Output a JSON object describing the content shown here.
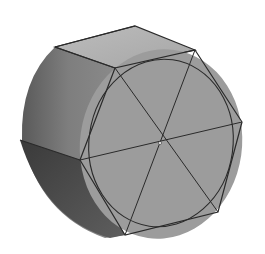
{
  "figure": {
    "colors": {
      "background": "#ffffff",
      "front_face": "#9a9a9a",
      "top_face": "#b4b4b4",
      "side_light": "#8a8a8a",
      "side_dark": "#3c3c3c",
      "edge": "#2a2a2a"
    }
  }
}
